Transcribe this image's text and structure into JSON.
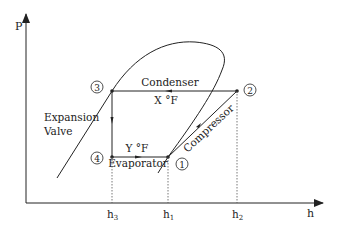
{
  "diagram": {
    "axes": {
      "y_label": "P",
      "x_label": "h",
      "x_ticks": [
        "h3",
        "h1",
        "h2"
      ]
    },
    "tick_labels": {
      "h3": {
        "base": "h",
        "sub": "3"
      },
      "h1": {
        "base": "h",
        "sub": "1"
      },
      "h2": {
        "base": "h",
        "sub": "2"
      }
    },
    "states": [
      {
        "id": "1",
        "label": "1"
      },
      {
        "id": "2",
        "label": "2"
      },
      {
        "id": "3",
        "label": "3"
      },
      {
        "id": "4",
        "label": "4"
      }
    ],
    "processes": {
      "condenser": {
        "label": "Condenser",
        "temp": "X °F"
      },
      "evaporator": {
        "label": "Evaporator",
        "temp": "Y °F"
      },
      "compressor": {
        "label": "Compressor"
      },
      "expansion": {
        "label_line1": "Expansion",
        "label_line2": "Valve"
      }
    },
    "colors": {
      "line": "#222222",
      "dashed": "#555555",
      "background": "#ffffff"
    }
  }
}
